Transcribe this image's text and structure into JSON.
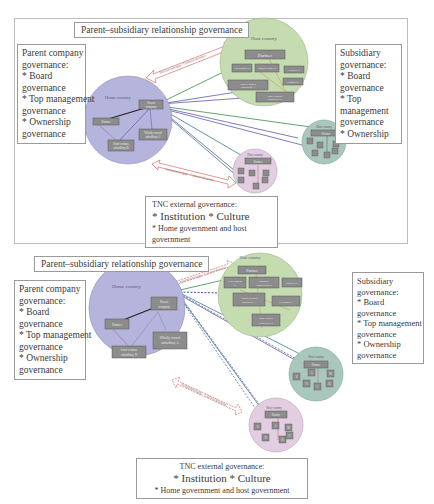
{
  "diagram_top": {
    "title": "Parent–subsidiary relationship governance",
    "parent_governance": {
      "heading": "Parent company governance:",
      "lines": [
        "Parent company",
        "governance:",
        "* Board",
        "governance",
        "* Top management",
        "governance",
        "* Ownership",
        "governance"
      ]
    },
    "subsidiary_governance": {
      "lines": [
        "Subsidiary",
        "governance:",
        "* Board",
        "governance",
        "* Top",
        "management",
        "governance",
        "* Ownership"
      ]
    },
    "external_governance": {
      "heading": "TNC external governance:",
      "line1": "* Institution * Culture",
      "line2": "* Home government and host government"
    },
    "home_country": {
      "label": "Home country",
      "nodes": [
        "Parent company",
        "Partner",
        "Wholly owned subsidiary A",
        "Joint-venture subsidiary B"
      ]
    },
    "host_country_main": {
      "label": "Host country",
      "nodes": [
        "Partner",
        "Government B",
        "Industry association B",
        "Supplier C",
        "Wholly owned subsidiary A",
        "Customer C",
        "Joint-venture subsidiary B"
      ]
    },
    "host_country_small_1": {
      "label": "Host country",
      "nodes": [
        "Partner",
        "S",
        "A",
        "M",
        "B",
        "C",
        "N"
      ]
    },
    "host_country_small_2": {
      "label": "Host country",
      "nodes": [
        "Partner",
        "S",
        "A",
        "M",
        "B",
        "C",
        "N"
      ]
    },
    "arrow_label": "Institutional gap / Cultural distance"
  },
  "diagram_bottom": {
    "title": "Parent–subsidiary relationship governance",
    "parent_governance": {
      "lines": [
        "Parent company",
        "governance:",
        "* Board",
        "governance",
        "* Top management",
        "governance",
        "* Ownership",
        "governance"
      ]
    },
    "subsidiary_governance": {
      "lines": [
        "Subsidiary",
        "governance:",
        "* Board",
        "governance",
        "* Top management",
        "governance",
        "* Ownership",
        "governance"
      ]
    },
    "external_governance": {
      "heading": "TNC external governance:",
      "line1": "* Institution * Culture",
      "line2": "* Home government and host government"
    },
    "home_country": {
      "label": "Home country",
      "nodes": [
        "Parent company",
        "Partner",
        "Wholly owned subsidiary A",
        "Joint-venture subsidiary B"
      ]
    },
    "host_country_main": {
      "label": "Host country",
      "nodes": [
        "Partner",
        "Government B",
        "Industry association B",
        "Supplier C",
        "Wholly owned subsidiary A",
        "Customer C",
        "Joint-venture subsidiary B"
      ]
    },
    "host_country_small_1": {
      "label": "Host country",
      "nodes": [
        "Partner",
        "S",
        "A",
        "M",
        "B",
        "C",
        "N"
      ]
    },
    "host_country_small_2": {
      "label": "Host country",
      "nodes": [
        "Partner",
        "S",
        "A",
        "M",
        "B",
        "C",
        "N"
      ]
    },
    "arrow_label": "Institutional gap / Cultural distance"
  },
  "colors": {
    "home_circle": "#b4b4dc",
    "host_main_circle": "#c5dcb0",
    "host_small_1_circle": "#a9c7bd",
    "host_small_2_circle": "#e3cde0",
    "node_fill": "#8c8c8c",
    "arrow_red": "#d9807a",
    "line_green": "#4f9a5a",
    "line_blue": "#6d6fb5",
    "line_teal": "#4f8d93"
  }
}
